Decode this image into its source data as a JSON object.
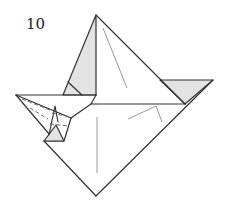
{
  "diagram": {
    "type": "origami-step",
    "step_number": "10",
    "colors": {
      "line": "#333333",
      "shaded_flap": "#e3e3e3",
      "crease": "#8a8a8a",
      "background": "#ffffff"
    }
  }
}
